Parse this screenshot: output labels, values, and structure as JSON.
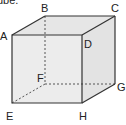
{
  "caption": "ube.",
  "cube": {
    "vertices": {
      "A": "A",
      "B": "B",
      "C": "C",
      "D": "D",
      "E": "E",
      "F": "F",
      "G": "G",
      "H": "H"
    },
    "colors": {
      "face": "#ebebeb",
      "edge": "#333333",
      "hidden_edge": "#555555"
    }
  }
}
